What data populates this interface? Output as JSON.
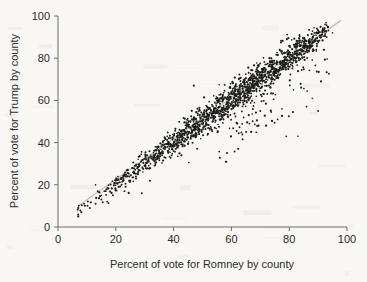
{
  "figure": {
    "name": "scatter-plot-romney-trump",
    "background_color": "#f8f7f4",
    "ink_color": "#1d1d1d",
    "axis_color": "#6d6d6d",
    "reference_line_color": "#b9b7b2"
  },
  "axes": {
    "x_title": "Percent of vote for Romney by county",
    "y_title": "Percent of vote for Trump by county",
    "x_ticks": [
      "0",
      "20",
      "40",
      "60",
      "80",
      "100"
    ],
    "y_ticks": [
      "0",
      "20",
      "40",
      "60",
      "80",
      "100"
    ]
  },
  "chart_data": {
    "type": "scatter",
    "title": "",
    "xlabel": "Percent of vote for Romney by county",
    "ylabel": "Percent of vote for Trump by county",
    "xlim": [
      0,
      100
    ],
    "ylim": [
      0,
      100
    ],
    "xticks": [
      0,
      20,
      40,
      60,
      80,
      100
    ],
    "yticks": [
      0,
      20,
      40,
      60,
      80,
      100
    ],
    "grid": false,
    "legend": "none",
    "marker": "filled-circle",
    "marker_size_px": 1.6,
    "marker_color": "#1d1d1d",
    "annotations": [
      {
        "type": "line",
        "name": "identity-reference-line",
        "color": "#b9b7b2",
        "x": [
          7,
          98
        ],
        "y": [
          10,
          98
        ]
      }
    ],
    "series": [
      {
        "name": "US counties",
        "n_points_drawn": 1450,
        "description": "Dense positively-correlated band; Trump share tracks Romney share closely with a cluster of high-Romney counties falling well below the trend.",
        "generator": {
          "mode": "band-plus-outliers",
          "band": {
            "x_range": [
              6,
              94
            ],
            "slope": 1.0,
            "intercept": 0.5,
            "sigma_core": 2.6,
            "density_profile": [
              {
                "x": 6,
                "w": 0.05
              },
              {
                "x": 15,
                "w": 0.12
              },
              {
                "x": 25,
                "w": 0.3
              },
              {
                "x": 35,
                "w": 0.55
              },
              {
                "x": 45,
                "w": 0.85
              },
              {
                "x": 55,
                "w": 1.0
              },
              {
                "x": 65,
                "w": 1.0
              },
              {
                "x": 75,
                "w": 0.95
              },
              {
                "x": 83,
                "w": 0.85
              },
              {
                "x": 89,
                "w": 0.55
              },
              {
                "x": 94,
                "w": 0.15
              }
            ]
          },
          "low_outliers": {
            "count": 70,
            "x_range": [
              55,
              94
            ],
            "offset_range": [
              -9,
              -28
            ]
          },
          "high_outliers": {
            "count": 14,
            "x_range": [
              40,
              92
            ],
            "offset_range": [
              5,
              13
            ]
          },
          "seed": 20161108
        },
        "sample_points": [
          [
            7,
            5
          ],
          [
            7,
            9
          ],
          [
            9,
            11
          ],
          [
            11,
            9
          ],
          [
            13,
            11
          ],
          [
            13,
            20
          ],
          [
            15,
            13
          ],
          [
            16,
            17
          ],
          [
            17,
            12
          ],
          [
            19,
            15
          ],
          [
            20,
            22
          ],
          [
            21,
            19
          ],
          [
            22,
            20
          ],
          [
            23,
            17
          ],
          [
            24,
            24
          ],
          [
            25,
            22
          ],
          [
            26,
            26
          ],
          [
            27,
            23
          ],
          [
            28,
            27
          ],
          [
            29,
            16
          ],
          [
            30,
            29
          ],
          [
            31,
            31
          ],
          [
            32,
            30
          ],
          [
            33,
            33
          ],
          [
            34,
            32
          ],
          [
            35,
            35
          ],
          [
            36,
            34
          ],
          [
            37,
            37
          ],
          [
            38,
            36
          ],
          [
            39,
            39
          ],
          [
            40,
            38
          ],
          [
            41,
            41
          ],
          [
            42,
            40
          ],
          [
            43,
            43
          ],
          [
            44,
            45
          ],
          [
            45,
            44
          ],
          [
            46,
            47
          ],
          [
            47,
            46
          ],
          [
            47,
            67
          ],
          [
            48,
            49
          ],
          [
            49,
            48
          ],
          [
            50,
            51
          ],
          [
            51,
            50
          ],
          [
            52,
            53
          ],
          [
            53,
            52
          ],
          [
            54,
            55
          ],
          [
            55,
            54
          ],
          [
            56,
            57
          ],
          [
            57,
            56
          ],
          [
            58,
            31
          ],
          [
            59,
            59
          ],
          [
            60,
            58
          ],
          [
            61,
            61
          ],
          [
            62,
            60
          ],
          [
            63,
            63
          ],
          [
            64,
            62
          ],
          [
            65,
            65
          ],
          [
            66,
            64
          ],
          [
            67,
            67
          ],
          [
            68,
            66
          ],
          [
            69,
            69
          ],
          [
            70,
            68
          ],
          [
            71,
            71
          ],
          [
            72,
            70
          ],
          [
            73,
            73
          ],
          [
            74,
            72
          ],
          [
            75,
            75
          ],
          [
            76,
            74
          ],
          [
            77,
            77
          ],
          [
            78,
            76
          ],
          [
            79,
            79
          ],
          [
            80,
            78
          ],
          [
            81,
            81
          ],
          [
            82,
            80
          ],
          [
            83,
            83
          ],
          [
            84,
            82
          ],
          [
            85,
            85
          ],
          [
            86,
            84
          ],
          [
            87,
            87
          ],
          [
            88,
            86
          ],
          [
            89,
            89
          ],
          [
            90,
            88
          ],
          [
            91,
            90
          ],
          [
            93,
            90
          ],
          [
            62,
            49
          ],
          [
            66,
            53
          ],
          [
            70,
            55
          ],
          [
            72,
            48
          ],
          [
            76,
            51
          ],
          [
            79,
            43
          ],
          [
            83,
            43
          ],
          [
            86,
            57
          ],
          [
            88,
            61
          ],
          [
            90,
            55
          ],
          [
            91,
            69
          ],
          [
            92,
            84
          ],
          [
            95,
            92
          ]
        ]
      }
    ]
  }
}
